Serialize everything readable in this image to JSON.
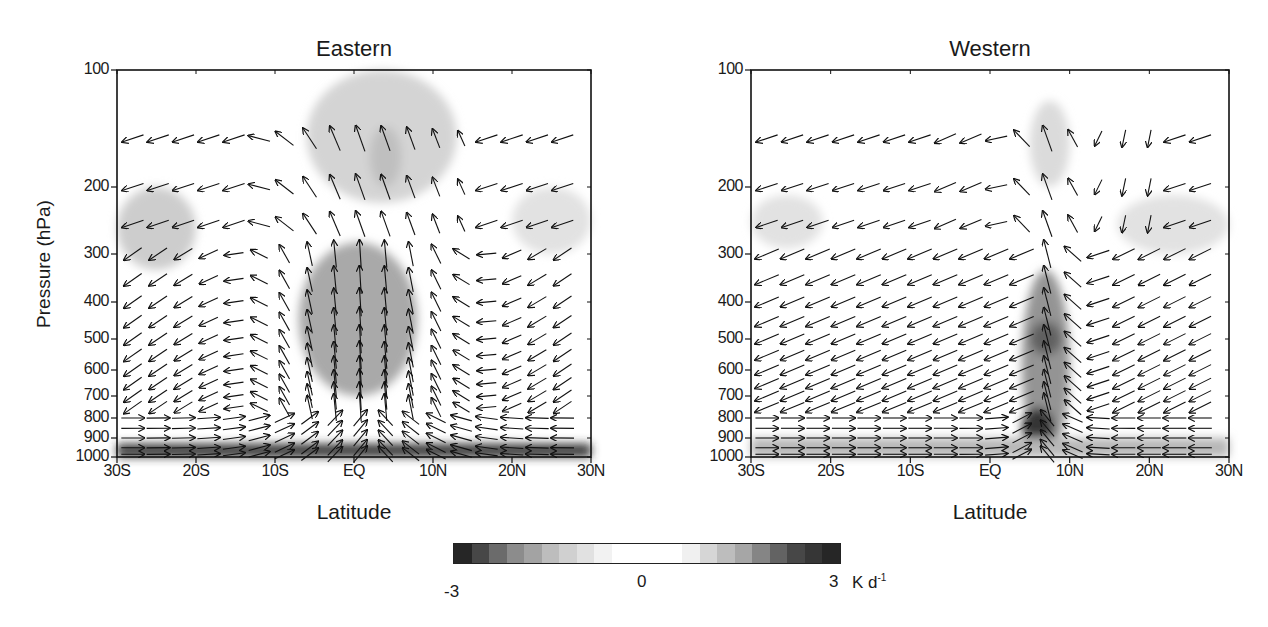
{
  "chart_data": [
    {
      "type": "heatmap",
      "subtype": "latitude-pressure cross-section with wind vectors (shading + quiver)",
      "title": "Eastern",
      "xlabel": "Latitude",
      "ylabel": "Pressure (hPa)",
      "x_ticks": [
        "30S",
        "20S",
        "10S",
        "EQ",
        "10N",
        "20N",
        "30N"
      ],
      "x_range": [
        -30,
        30
      ],
      "y_ticks": [
        100,
        200,
        300,
        400,
        500,
        600,
        700,
        800,
        900,
        1000
      ],
      "y_range": [
        100,
        1000
      ],
      "y_scale": "log-pressure (inverted)",
      "shading_features": [
        {
          "desc": "strong heating core",
          "lat_range": [
            -5,
            6
          ],
          "p_range": [
            400,
            600
          ],
          "value": -2.5
        },
        {
          "desc": "moderate heating dome",
          "lat_range": [
            -7,
            8
          ],
          "p_range": [
            280,
            700
          ],
          "value": -1.2
        },
        {
          "desc": "light upper-level blob",
          "lat_range": [
            -6,
            13
          ],
          "p_range": [
            100,
            220
          ],
          "value": -0.6
        },
        {
          "desc": "upper core",
          "lat_range": [
            2,
            6
          ],
          "p_range": [
            140,
            200
          ],
          "value": -0.9
        },
        {
          "desc": "southern subtropical blob",
          "lat_range": [
            -30,
            -20
          ],
          "p_range": [
            200,
            330
          ],
          "value": -0.7
        },
        {
          "desc": "northern subtropical blob",
          "lat_range": [
            20,
            30
          ],
          "p_range": [
            200,
            300
          ],
          "value": -0.4
        },
        {
          "desc": "boundary layer dark band",
          "lat_range": [
            -30,
            30
          ],
          "p_range": [
            930,
            1000
          ],
          "value": -2.8
        }
      ],
      "vector_pattern": "upward motion over EQ (10S–10N) with upper-level divergence; subsidence in subtropics; near-surface convergence"
    },
    {
      "type": "heatmap",
      "subtype": "latitude-pressure cross-section with wind vectors (shading + quiver)",
      "title": "Western",
      "xlabel": "Latitude",
      "ylabel": "",
      "x_ticks": [
        "30S",
        "20S",
        "10S",
        "EQ",
        "10N",
        "20N",
        "30N"
      ],
      "x_range": [
        -30,
        30
      ],
      "y_ticks": [
        100,
        200,
        300,
        400,
        500,
        600,
        700,
        800,
        900,
        1000
      ],
      "y_range": [
        100,
        1000
      ],
      "y_scale": "log-pressure (inverted)",
      "shading_features": [
        {
          "desc": "narrow convective column",
          "lat_range": [
            4,
            10
          ],
          "p_range": [
            330,
            1000
          ],
          "value": -1.5
        },
        {
          "desc": "column core",
          "lat_range": [
            5,
            9
          ],
          "p_range": [
            450,
            550
          ],
          "value": -2.2
        },
        {
          "desc": "low-level core",
          "lat_range": [
            4,
            8
          ],
          "p_range": [
            750,
            950
          ],
          "value": -2.8
        },
        {
          "desc": "upper blob",
          "lat_range": [
            5,
            10
          ],
          "p_range": [
            120,
            200
          ],
          "value": -0.5
        },
        {
          "desc": "southern subtropical blob",
          "lat_range": [
            -30,
            -21
          ],
          "p_range": [
            210,
            290
          ],
          "value": -0.4
        },
        {
          "desc": "northern subtropical blob",
          "lat_range": [
            16,
            30
          ],
          "p_range": [
            210,
            300
          ],
          "value": -0.4
        },
        {
          "desc": "boundary layer band",
          "lat_range": [
            -30,
            30
          ],
          "p_range": [
            900,
            1000
          ],
          "value": -1.0
        }
      ],
      "vector_pattern": "narrow ascent near 5–10N; broad northeasterly/southwesterly return flow toward ascent; low-level inflow from both hemispheres"
    }
  ],
  "panels": {
    "left": {
      "title": "Eastern",
      "ylabel": "Pressure (hPa)",
      "xlabel": "Latitude"
    },
    "right": {
      "title": "Western",
      "xlabel": "Latitude"
    }
  },
  "axes": {
    "y_ticks": [
      "100",
      "200",
      "300",
      "400",
      "500",
      "600",
      "700",
      "800",
      "900",
      "1000"
    ],
    "x_ticks": [
      "30S",
      "20S",
      "10S",
      "EQ",
      "10N",
      "20N",
      "30N"
    ]
  },
  "colorbar": {
    "min_label": "-3",
    "mid_label": "0",
    "max_label": "3",
    "unit": "K d",
    "unit_sup": "-1",
    "colors": [
      "#262626",
      "#474747",
      "#6b6b6b",
      "#8c8c8c",
      "#a3a3a3",
      "#bdbdbd",
      "#d0d0d0",
      "#e1e1e1",
      "#f2f2f2",
      "#ffffff",
      "#ffffff",
      "#ffffff",
      "#ffffff",
      "#f0f0f0",
      "#d6d6d6",
      "#bdbdbd",
      "#a6a6a6",
      "#858585",
      "#636363",
      "#474747",
      "#363636",
      "#262626"
    ]
  }
}
